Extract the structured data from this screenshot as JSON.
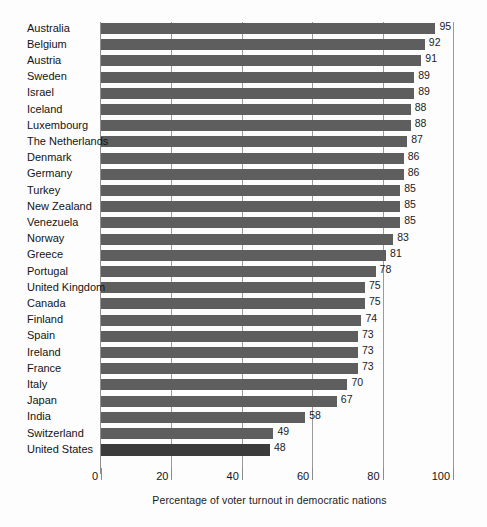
{
  "chart_data": {
    "type": "bar",
    "orientation": "horizontal",
    "title": "",
    "subtitle": "",
    "xlabel": "Percentage of voter turnout in democratic nations",
    "ylabel": "",
    "xlim": [
      0,
      100
    ],
    "xticks": [
      0,
      20,
      40,
      60,
      80,
      100
    ],
    "xtick_labels": [
      "0",
      "20",
      "40",
      "60",
      "80",
      "100"
    ],
    "grid": "vertical",
    "legend": "none",
    "bar_color": "#5e5e5e",
    "highlight_color": "#3b3b3b",
    "categories": [
      "Australia",
      "Belgium",
      "Austria",
      "Sweden",
      "Israel",
      "Iceland",
      "Luxembourg",
      "The Netherlands",
      "Denmark",
      "Germany",
      "Turkey",
      "New Zealand",
      "Venezuela",
      "Norway",
      "Greece",
      "Portugal",
      "United Kingdom",
      "Canada",
      "Finland",
      "Spain",
      "Ireland",
      "France",
      "Italy",
      "Japan",
      "India",
      "Switzerland",
      "United States"
    ],
    "values": [
      95,
      92,
      91,
      89,
      89,
      88,
      88,
      87,
      86,
      86,
      85,
      85,
      85,
      83,
      81,
      78,
      75,
      75,
      74,
      73,
      73,
      73,
      70,
      67,
      58,
      49,
      48
    ],
    "value_labels": [
      "95",
      "92",
      "91",
      "89",
      "89",
      "88",
      "88",
      "87",
      "86",
      "86",
      "85",
      "85",
      "85",
      "83",
      "81",
      "78",
      "75",
      "75",
      "74",
      "73",
      "73",
      "73",
      "70",
      "67",
      "58",
      "49",
      "48"
    ]
  }
}
